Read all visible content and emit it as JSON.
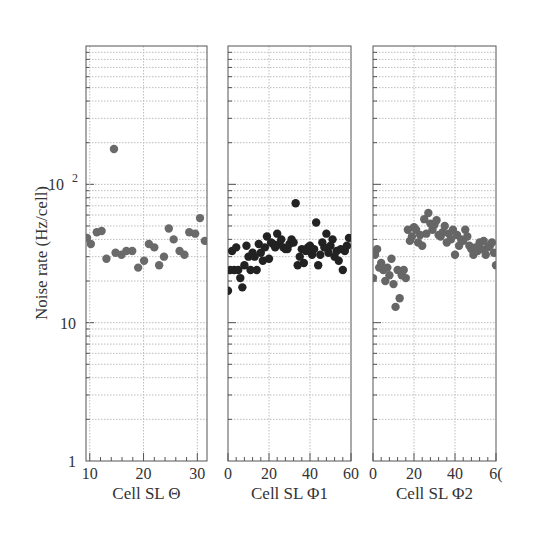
{
  "chart_data": {
    "type": "scatter",
    "ylabel": "Noise rate (Hz/cell)",
    "yscale": "log",
    "ylim": [
      1,
      1000
    ],
    "y_tick_labels": [
      {
        "value": 1,
        "label": "1"
      },
      {
        "value": 10,
        "label": "10"
      },
      {
        "value": 100,
        "label": "10",
        "sup": "2"
      }
    ],
    "grid": true,
    "panels": [
      {
        "xlabel": "Cell SL Θ",
        "xlim": [
          9.3,
          31.8
        ],
        "x_ticks": [
          10,
          20,
          30
        ],
        "x_tick_labels": [
          "10",
          "20",
          "30"
        ],
        "color": "#6a6a6a",
        "points": [
          [
            9.5,
            41
          ],
          [
            10.2,
            37
          ],
          [
            11.3,
            45
          ],
          [
            12.2,
            46
          ],
          [
            13.1,
            29
          ],
          [
            14.5,
            180
          ],
          [
            14.8,
            32
          ],
          [
            15.9,
            31
          ],
          [
            16.8,
            33
          ],
          [
            17.9,
            33
          ],
          [
            19.0,
            25
          ],
          [
            20.1,
            28
          ],
          [
            21.0,
            37
          ],
          [
            22.0,
            35
          ],
          [
            22.9,
            26
          ],
          [
            23.8,
            30
          ],
          [
            24.7,
            48
          ],
          [
            25.6,
            40
          ],
          [
            26.7,
            33
          ],
          [
            27.6,
            31
          ],
          [
            28.5,
            45
          ],
          [
            29.6,
            44
          ],
          [
            30.5,
            57
          ],
          [
            31.4,
            39
          ]
        ]
      },
      {
        "xlabel": "Cell SL Φ1",
        "xlim": [
          0,
          60
        ],
        "x_ticks": [
          0,
          20,
          40,
          60
        ],
        "x_tick_labels": [
          "0",
          "20",
          "40",
          "60"
        ],
        "color": "#222222",
        "points": [
          [
            0,
            17
          ],
          [
            1,
            24
          ],
          [
            2,
            33
          ],
          [
            3,
            24
          ],
          [
            4,
            35
          ],
          [
            5,
            24
          ],
          [
            6,
            21
          ],
          [
            7,
            18
          ],
          [
            8,
            26
          ],
          [
            9,
            36
          ],
          [
            10,
            30
          ],
          [
            11,
            24
          ],
          [
            12,
            32
          ],
          [
            13,
            30
          ],
          [
            14,
            24
          ],
          [
            15,
            37
          ],
          [
            16,
            32
          ],
          [
            17,
            28
          ],
          [
            18,
            35
          ],
          [
            19,
            42
          ],
          [
            20,
            29
          ],
          [
            21,
            38
          ],
          [
            22,
            37
          ],
          [
            23,
            35
          ],
          [
            24,
            44
          ],
          [
            25,
            37
          ],
          [
            26,
            40
          ],
          [
            27,
            35
          ],
          [
            28,
            34
          ],
          [
            29,
            34
          ],
          [
            30,
            37
          ],
          [
            31,
            40
          ],
          [
            32,
            38
          ],
          [
            33,
            73
          ],
          [
            34,
            26
          ],
          [
            35,
            30
          ],
          [
            36,
            34
          ],
          [
            37,
            27
          ],
          [
            38,
            33
          ],
          [
            39,
            35
          ],
          [
            40,
            36
          ],
          [
            41,
            31
          ],
          [
            42,
            34
          ],
          [
            43,
            53
          ],
          [
            44,
            26
          ],
          [
            45,
            31
          ],
          [
            46,
            38
          ],
          [
            47,
            35
          ],
          [
            48,
            44
          ],
          [
            49,
            32
          ],
          [
            50,
            36
          ],
          [
            51,
            40
          ],
          [
            52,
            30
          ],
          [
            53,
            33
          ],
          [
            54,
            28
          ],
          [
            55,
            34
          ],
          [
            56,
            24
          ],
          [
            57,
            33
          ],
          [
            58,
            36
          ],
          [
            59,
            41
          ]
        ]
      },
      {
        "xlabel": "Cell SL Φ2",
        "xlim": [
          0,
          60
        ],
        "x_ticks": [
          0,
          20,
          40,
          60
        ],
        "x_tick_labels": [
          "0",
          "20",
          "40",
          "6("
        ],
        "color": "#666666",
        "points": [
          [
            0,
            21
          ],
          [
            1,
            31
          ],
          [
            2,
            34
          ],
          [
            3,
            25
          ],
          [
            4,
            27
          ],
          [
            5,
            24
          ],
          [
            6,
            20
          ],
          [
            7,
            25
          ],
          [
            8,
            22
          ],
          [
            9,
            29
          ],
          [
            10,
            19
          ],
          [
            11,
            13
          ],
          [
            12,
            24
          ],
          [
            13,
            15
          ],
          [
            14,
            22
          ],
          [
            15,
            24
          ],
          [
            16,
            21
          ],
          [
            17,
            47
          ],
          [
            18,
            39
          ],
          [
            19,
            42
          ],
          [
            20,
            49
          ],
          [
            21,
            47
          ],
          [
            22,
            38
          ],
          [
            23,
            43
          ],
          [
            24,
            36
          ],
          [
            25,
            56
          ],
          [
            26,
            44
          ],
          [
            27,
            62
          ],
          [
            28,
            52
          ],
          [
            29,
            47
          ],
          [
            30,
            51
          ],
          [
            31,
            55
          ],
          [
            32,
            43
          ],
          [
            33,
            42
          ],
          [
            34,
            45
          ],
          [
            35,
            50
          ],
          [
            36,
            38
          ],
          [
            37,
            44
          ],
          [
            38,
            40
          ],
          [
            39,
            47
          ],
          [
            40,
            31
          ],
          [
            41,
            43
          ],
          [
            42,
            36
          ],
          [
            43,
            40
          ],
          [
            44,
            39
          ],
          [
            45,
            47
          ],
          [
            46,
            42
          ],
          [
            47,
            36
          ],
          [
            48,
            34
          ],
          [
            49,
            31
          ],
          [
            50,
            35
          ],
          [
            51,
            33
          ],
          [
            52,
            38
          ],
          [
            53,
            34
          ],
          [
            54,
            39
          ],
          [
            55,
            31
          ],
          [
            56,
            35
          ],
          [
            57,
            36
          ],
          [
            58,
            38
          ],
          [
            59,
            32
          ],
          [
            60,
            26
          ]
        ]
      }
    ]
  },
  "layout_colors": {
    "frame": "#555555",
    "grid": "#bdbdbd",
    "text": "#333333"
  }
}
